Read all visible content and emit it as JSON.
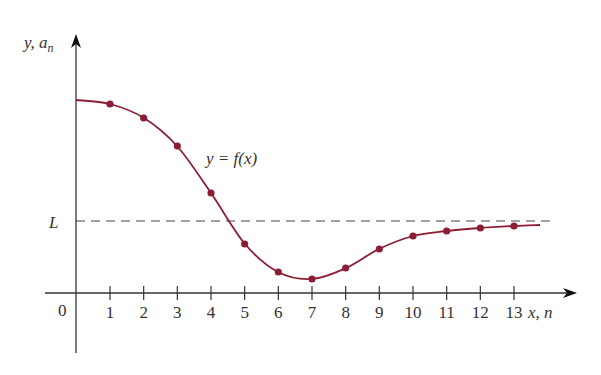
{
  "chart_data": {
    "type": "line",
    "title": "",
    "xlabel": "x, n",
    "ylabel": "y, a_n",
    "ylabel_parts": {
      "y": "y, a",
      "sub": "n"
    },
    "origin_label": "0",
    "curve_label": "y = f(x)",
    "asymptote_label": "L",
    "x_ticks": [
      1,
      2,
      3,
      4,
      5,
      6,
      7,
      8,
      9,
      10,
      11,
      12,
      13
    ],
    "grid": false,
    "legend": "none",
    "asymptote": {
      "name": "L",
      "style": "dashed",
      "value_px_y": 221
    },
    "series": [
      {
        "name": "f(x) curve",
        "style": "solid",
        "color": "#8b1e35",
        "points_px": [
          [
            76,
            100
          ],
          [
            110,
            104
          ],
          [
            144,
            118
          ],
          [
            177,
            146
          ],
          [
            211,
            193
          ],
          [
            245,
            244
          ],
          [
            278,
            272
          ],
          [
            312,
            279
          ],
          [
            346,
            268
          ],
          [
            379,
            249
          ],
          [
            413,
            236
          ],
          [
            447,
            231
          ],
          [
            480,
            228
          ],
          [
            514,
            226
          ],
          [
            540,
            225
          ]
        ]
      },
      {
        "name": "a_n sequence",
        "style": "markers",
        "color": "#8b1e35",
        "n": [
          1,
          2,
          3,
          4,
          5,
          6,
          7,
          8,
          9,
          10,
          11,
          12,
          13
        ],
        "values_relative_to_L": [
          1.0,
          0.85,
          0.58,
          0.14,
          -0.34,
          -0.6,
          -0.66,
          -0.56,
          -0.39,
          -0.26,
          -0.21,
          -0.18,
          -0.16
        ],
        "values_px_y": [
          104,
          118,
          146,
          193,
          244,
          272,
          279,
          268,
          249,
          236,
          231,
          228,
          226
        ]
      }
    ]
  },
  "colors": {
    "curve": "#8b1e35",
    "axis": "#333333",
    "dash": "#444444",
    "text": "#333333"
  }
}
